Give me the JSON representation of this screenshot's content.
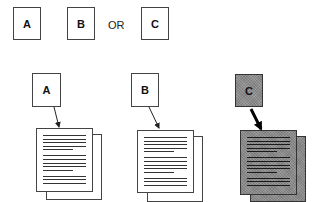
{
  "top_row": {
    "boxes": [
      {
        "label": "A"
      },
      {
        "label": "B"
      },
      {
        "label": "C"
      }
    ],
    "connector": "OR"
  },
  "bottom_row": {
    "groups": [
      {
        "label": "A",
        "shaded": false,
        "arrow": "thin",
        "document": "stacked-pages"
      },
      {
        "label": "B",
        "shaded": false,
        "arrow": "thin",
        "document": "stacked-pages"
      },
      {
        "label": "C",
        "shaded": true,
        "arrow": "thick",
        "document": "stacked-pages-shaded"
      }
    ]
  },
  "colors": {
    "outline": "#444444",
    "shade": "#8e8e8e",
    "background": "#ffffff"
  }
}
